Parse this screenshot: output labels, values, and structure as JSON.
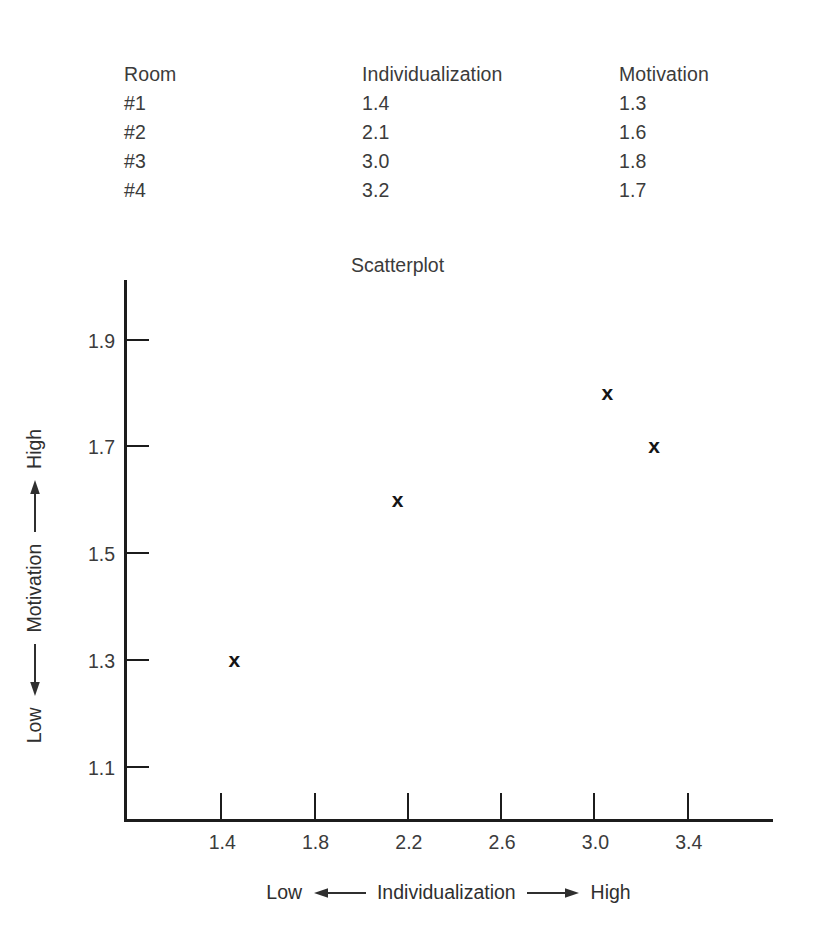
{
  "table": {
    "headers": [
      "Room",
      "Individualization",
      "Motivation"
    ],
    "rows": [
      {
        "room": "#1",
        "individualization": "1.4",
        "motivation": "1.3"
      },
      {
        "room": "#2",
        "individualization": "2.1",
        "motivation": "1.6"
      },
      {
        "room": "#3",
        "individualization": "3.0",
        "motivation": "1.8"
      },
      {
        "room": "#4",
        "individualization": "3.2",
        "motivation": "1.7"
      }
    ]
  },
  "chart_data": {
    "type": "scatter",
    "title": "Scatterplot",
    "xlabel": "Low ← Individualization → High",
    "ylabel": "Low ← Motivation → High",
    "xlabel_parts": {
      "low": "Low",
      "name": "Individualization",
      "high": "High"
    },
    "ylabel_parts": {
      "low": "Low",
      "name": "Motivation",
      "high": "High"
    },
    "x": [
      1.4,
      2.1,
      3.0,
      3.2
    ],
    "y": [
      1.3,
      1.6,
      1.8,
      1.7
    ],
    "point_labels": [
      "#1",
      "#2",
      "#3",
      "#4"
    ],
    "marker": "x",
    "marker_color": "#151515",
    "axis_color": "#1c1c1c",
    "xticks": [
      "1.4",
      "1.8",
      "2.2",
      "2.6",
      "3.0",
      "3.4"
    ],
    "xtick_values": [
      1.4,
      1.8,
      2.2,
      2.6,
      3.0,
      3.4
    ],
    "yticks": [
      "1.1",
      "1.3",
      "1.5",
      "1.7",
      "1.9"
    ],
    "ytick_values": [
      1.1,
      1.3,
      1.5,
      1.7,
      1.9
    ],
    "xlim": [
      1.0,
      3.77
    ],
    "ylim": [
      1.0,
      2.01
    ],
    "grid": false,
    "legend": null
  }
}
